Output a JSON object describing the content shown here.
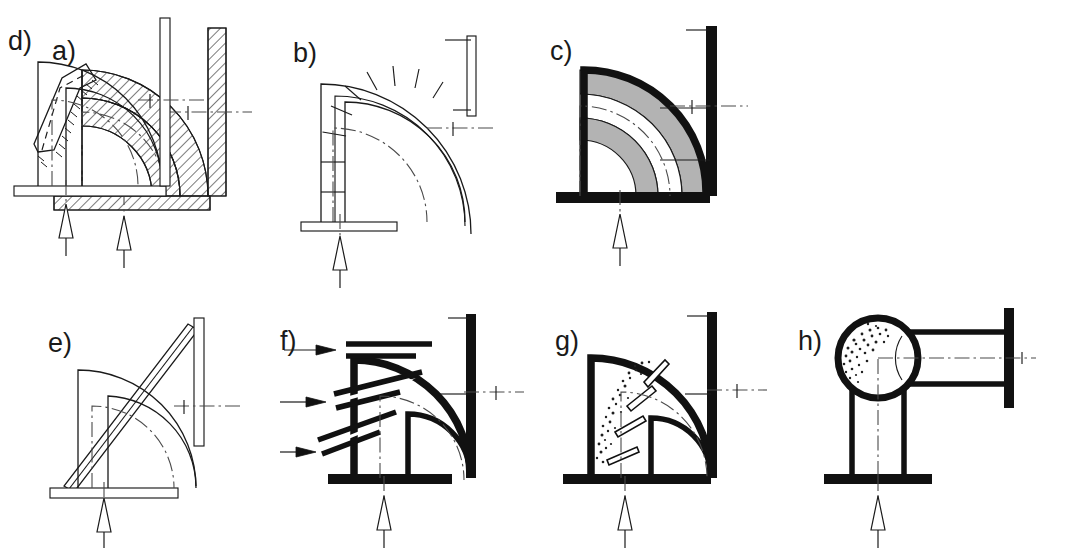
{
  "figure": {
    "background_color": "#ffffff",
    "line_color": "#1a1a1a",
    "gray_lining_color": "#b3b3b3",
    "heavy_wall_color": "#111111",
    "centerline_color": "#4a4a4a",
    "rows": 2,
    "columns": 4
  },
  "panels": [
    {
      "id": "a",
      "label": "a)",
      "description": "Sectioned cast elbow with hatched wall and hatched flanges at both ends",
      "wall_style": "section-hatched",
      "flange_inlet": "hatched",
      "flange_outlet": "hatched",
      "flow_arrow": "hollow-up",
      "centerline": "dash-dot"
    },
    {
      "id": "b",
      "label": "b)",
      "description": "Segmented mitered elbow fabricated from welded segments",
      "wall_style": "segmented",
      "segment_count": 8,
      "flange_inlet": "thin-plate",
      "flange_outlet": "thin-plate",
      "flow_arrow": "hollow-up",
      "centerline": "dash-dot"
    },
    {
      "id": "c",
      "label": "c)",
      "description": "Lined elbow with heavy outer wall and gray wear-resistant lining",
      "wall_style": "heavy-with-gray-lining",
      "lining_color": "#b3b3b3",
      "flange_inlet": "solid-black",
      "flange_outlet": "solid-black",
      "flow_arrow": "hollow-up",
      "centerline": "dash-dot"
    },
    {
      "id": "d",
      "label": "d)",
      "description": "Elbow with welded reinforcement patch on the outer curve, weld stitch marks on edges",
      "wall_style": "thin-with-patch",
      "flange_inlet": "thin-plate",
      "flange_outlet": "thin-plate",
      "flow_arrow": "hollow-up",
      "centerline": "dash-dot"
    },
    {
      "id": "e",
      "label": "e)",
      "description": "Elbow with straight tangential bar laid as a chord across the outer bend",
      "wall_style": "thin-with-chord-bar",
      "flange_inlet": "thin-plate",
      "flange_outlet": "thin-plate",
      "flow_arrow": "hollow-up",
      "centerline": "dash-dot"
    },
    {
      "id": "f",
      "label": "f)",
      "description": "Elbow with three injection nozzles entering the outer wall, inflow shown by solid arrows",
      "wall_style": "heavy",
      "nozzle_count": 3,
      "inflow_arrows": 3,
      "inflow_arrow_style": "solid-right",
      "flange_inlet": "solid-black",
      "flange_outlet": "solid-black",
      "flow_arrow": "hollow-up",
      "centerline": "dash-dot"
    },
    {
      "id": "g",
      "label": "g)",
      "description": "Elbow with internal radial vanes on the outer wall and stippled granular deposit between them",
      "wall_style": "heavy-with-vanes",
      "vane_count": 4,
      "deposit": "stippled",
      "flange_inlet": "solid-black",
      "flange_outlet": "solid-black",
      "flow_arrow": "hollow-up",
      "centerline": "dash-dot"
    },
    {
      "id": "h",
      "label": "h)",
      "description": "Blind-tee / pocketed elbow with spherical chamber and stippled deposit in the dead pocket",
      "wall_style": "heavy-sphere-tee",
      "deposit": "stippled",
      "flange_inlet": "solid-black",
      "flange_outlet": "solid-black",
      "flow_arrow": "hollow-up",
      "centerline": "dash-dot"
    }
  ]
}
